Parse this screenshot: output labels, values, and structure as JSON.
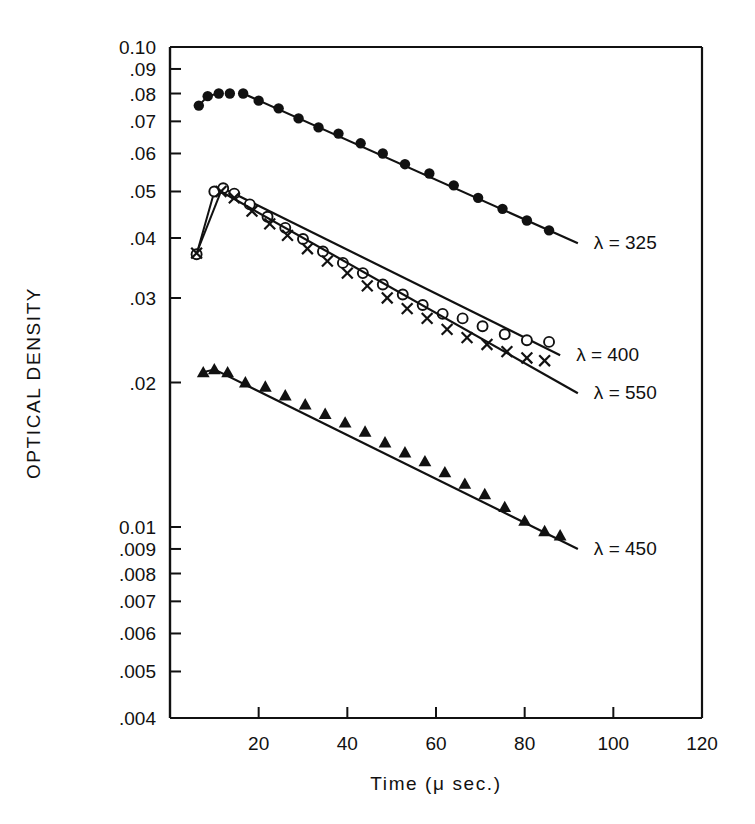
{
  "figure": {
    "background": "#ffffff",
    "ink": "#111111",
    "width": 755,
    "height": 824
  },
  "chart_data": {
    "type": "scatter",
    "title": "",
    "xlabel": "Time (μ sec.)",
    "ylabel": "OPTICAL DENSITY",
    "xscale": "linear",
    "yscale": "log",
    "xlim": [
      0,
      120
    ],
    "ylim": [
      0.004,
      0.1
    ],
    "grid": false,
    "legend_position": "right-inline-annotations",
    "xticks": [
      20,
      40,
      60,
      80,
      100,
      120
    ],
    "xtick_labels": [
      "20",
      "40",
      "60",
      "80",
      "100",
      "120"
    ],
    "yticks": [
      0.004,
      0.005,
      0.006,
      0.007,
      0.008,
      0.009,
      0.01,
      0.02,
      0.03,
      0.04,
      0.05,
      0.06,
      0.07,
      0.08,
      0.09,
      0.1
    ],
    "ytick_labels": [
      ".004",
      ".005",
      ".006",
      ".007",
      ".008",
      ".009",
      "0.01",
      ".02",
      ".03",
      ".04",
      ".05",
      ".06",
      ".07",
      ".08",
      ".09",
      "0.10"
    ],
    "series": [
      {
        "name": "λ = 325",
        "label": "λ = 325",
        "marker": "filled-circle",
        "annotation": "λ = 325",
        "points": [
          {
            "x": 6.5,
            "y": 0.0755
          },
          {
            "x": 8.5,
            "y": 0.079
          },
          {
            "x": 11.0,
            "y": 0.08
          },
          {
            "x": 13.5,
            "y": 0.08
          },
          {
            "x": 16.5,
            "y": 0.08
          },
          {
            "x": 20.0,
            "y": 0.0773
          },
          {
            "x": 24.5,
            "y": 0.0745
          },
          {
            "x": 29.0,
            "y": 0.071
          },
          {
            "x": 33.5,
            "y": 0.068
          },
          {
            "x": 38.0,
            "y": 0.066
          },
          {
            "x": 43.0,
            "y": 0.063
          },
          {
            "x": 48.0,
            "y": 0.06
          },
          {
            "x": 53.0,
            "y": 0.057
          },
          {
            "x": 58.5,
            "y": 0.0545
          },
          {
            "x": 64.0,
            "y": 0.0515
          },
          {
            "x": 69.5,
            "y": 0.0485
          },
          {
            "x": 75.0,
            "y": 0.046
          },
          {
            "x": 80.5,
            "y": 0.0435
          },
          {
            "x": 85.5,
            "y": 0.0415
          }
        ],
        "fit_line": {
          "x1": 16.5,
          "y1": 0.08,
          "x2": 92.0,
          "y2": 0.039
        }
      },
      {
        "name": "λ = 400",
        "label": "λ = 400",
        "marker": "open-circle",
        "annotation": "λ = 400",
        "points": [
          {
            "x": 6.0,
            "y": 0.037
          },
          {
            "x": 10.0,
            "y": 0.05
          },
          {
            "x": 12.0,
            "y": 0.0508
          },
          {
            "x": 14.5,
            "y": 0.0495
          },
          {
            "x": 18.0,
            "y": 0.047
          },
          {
            "x": 22.0,
            "y": 0.0443
          },
          {
            "x": 26.0,
            "y": 0.042
          },
          {
            "x": 30.0,
            "y": 0.0398
          },
          {
            "x": 34.5,
            "y": 0.0375
          },
          {
            "x": 39.0,
            "y": 0.0355
          },
          {
            "x": 43.5,
            "y": 0.0338
          },
          {
            "x": 48.0,
            "y": 0.032
          },
          {
            "x": 52.5,
            "y": 0.0305
          },
          {
            "x": 57.0,
            "y": 0.029
          },
          {
            "x": 61.5,
            "y": 0.0278
          },
          {
            "x": 66.0,
            "y": 0.0272
          },
          {
            "x": 70.5,
            "y": 0.0262
          },
          {
            "x": 75.5,
            "y": 0.0252
          },
          {
            "x": 80.5,
            "y": 0.0245
          },
          {
            "x": 85.5,
            "y": 0.0243
          }
        ],
        "fit_line": {
          "x1": 12.0,
          "y1": 0.0508,
          "x2": 88.0,
          "y2": 0.0228
        }
      },
      {
        "name": "λ = 550",
        "label": "λ = 550",
        "marker": "cross",
        "annotation": "λ = 550",
        "points": [
          {
            "x": 6.0,
            "y": 0.0372
          },
          {
            "x": 11.5,
            "y": 0.05
          },
          {
            "x": 14.5,
            "y": 0.0485
          },
          {
            "x": 18.5,
            "y": 0.0455
          },
          {
            "x": 22.5,
            "y": 0.0428
          },
          {
            "x": 26.5,
            "y": 0.0405
          },
          {
            "x": 31.0,
            "y": 0.038
          },
          {
            "x": 35.5,
            "y": 0.0358
          },
          {
            "x": 40.0,
            "y": 0.0338
          },
          {
            "x": 44.5,
            "y": 0.0318
          },
          {
            "x": 49.0,
            "y": 0.03
          },
          {
            "x": 53.5,
            "y": 0.0285
          },
          {
            "x": 58.0,
            "y": 0.0272
          },
          {
            "x": 62.5,
            "y": 0.0258
          },
          {
            "x": 67.0,
            "y": 0.0248
          },
          {
            "x": 71.5,
            "y": 0.024
          },
          {
            "x": 76.0,
            "y": 0.0232
          },
          {
            "x": 80.5,
            "y": 0.0225
          },
          {
            "x": 84.5,
            "y": 0.0222
          }
        ],
        "fit_line": {
          "x1": 11.5,
          "y1": 0.05,
          "x2": 92.0,
          "y2": 0.019
        }
      },
      {
        "name": "λ = 450",
        "label": "λ = 450",
        "marker": "filled-triangle",
        "annotation": "λ = 450",
        "points": [
          {
            "x": 7.5,
            "y": 0.021
          },
          {
            "x": 10.0,
            "y": 0.0213
          },
          {
            "x": 13.0,
            "y": 0.021
          },
          {
            "x": 17.0,
            "y": 0.02
          },
          {
            "x": 21.5,
            "y": 0.0196
          },
          {
            "x": 26.0,
            "y": 0.0188
          },
          {
            "x": 30.5,
            "y": 0.018
          },
          {
            "x": 35.0,
            "y": 0.0172
          },
          {
            "x": 39.5,
            "y": 0.0165
          },
          {
            "x": 44.0,
            "y": 0.0158
          },
          {
            "x": 48.5,
            "y": 0.015
          },
          {
            "x": 53.0,
            "y": 0.0143
          },
          {
            "x": 57.5,
            "y": 0.0137
          },
          {
            "x": 62.0,
            "y": 0.013
          },
          {
            "x": 66.5,
            "y": 0.0123
          },
          {
            "x": 71.0,
            "y": 0.0117
          },
          {
            "x": 75.5,
            "y": 0.011
          },
          {
            "x": 80.0,
            "y": 0.0103
          },
          {
            "x": 84.5,
            "y": 0.0098
          },
          {
            "x": 88.0,
            "y": 0.0096
          }
        ],
        "fit_line": {
          "x1": 10.0,
          "y1": 0.0213,
          "x2": 92.0,
          "y2": 0.009
        }
      }
    ]
  }
}
